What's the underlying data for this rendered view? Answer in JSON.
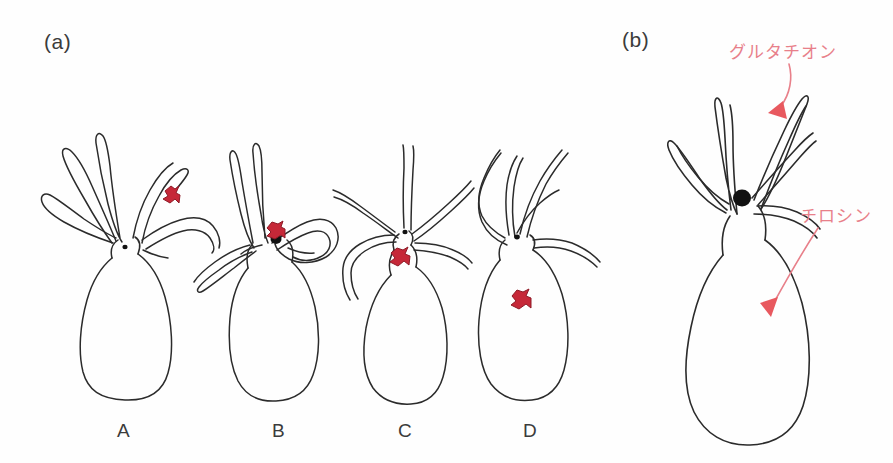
{
  "figure": {
    "background_color": "#fefefe",
    "width": 893,
    "height": 463
  },
  "panels": [
    {
      "id": "panel-a",
      "label": "(a)",
      "x": 44,
      "y": 30
    },
    {
      "id": "panel-b",
      "label": "(b)",
      "x": 622,
      "y": 28
    }
  ],
  "panel_a": {
    "specimens": [
      {
        "id": "specimen-a",
        "label": "A",
        "label_x": 117,
        "label_y": 420,
        "marker_color": "#C62838",
        "marker_location": "upper tentacle",
        "mouth_visible": true
      },
      {
        "id": "specimen-b",
        "label": "B",
        "label_x": 272,
        "label_y": 420,
        "marker_color": "#C62838",
        "marker_location": "mouth region",
        "mouth_visible": true
      },
      {
        "id": "specimen-c",
        "label": "C",
        "label_x": 398,
        "label_y": 420,
        "marker_color": "#C62838",
        "marker_location": "neck below mouth",
        "mouth_visible": true
      },
      {
        "id": "specimen-d",
        "label": "D",
        "label_x": 523,
        "label_y": 420,
        "marker_color": "#C62838",
        "marker_location": "body column",
        "mouth_visible": true
      }
    ]
  },
  "panel_b": {
    "annotations": [
      {
        "id": "annotation-glutathione",
        "text": "グルタチオン",
        "color": "#E8808A",
        "text_x": 729,
        "text_y": 38,
        "arrow_target": "tentacle region"
      },
      {
        "id": "annotation-tyrosine",
        "text": "チロシン",
        "color": "#E8808A",
        "text_x": 800,
        "text_y": 202,
        "arrow_target": "body column"
      }
    ],
    "mouth_visible": true,
    "mouth_color": "#111111"
  },
  "colors": {
    "outline": "#2b2b2b",
    "marker_red": "#C62838",
    "marker_red_dark": "#8e1a26",
    "annotation_pink": "#E8808A",
    "mouth_black": "#111111",
    "text_gray": "#3b3b3b"
  }
}
